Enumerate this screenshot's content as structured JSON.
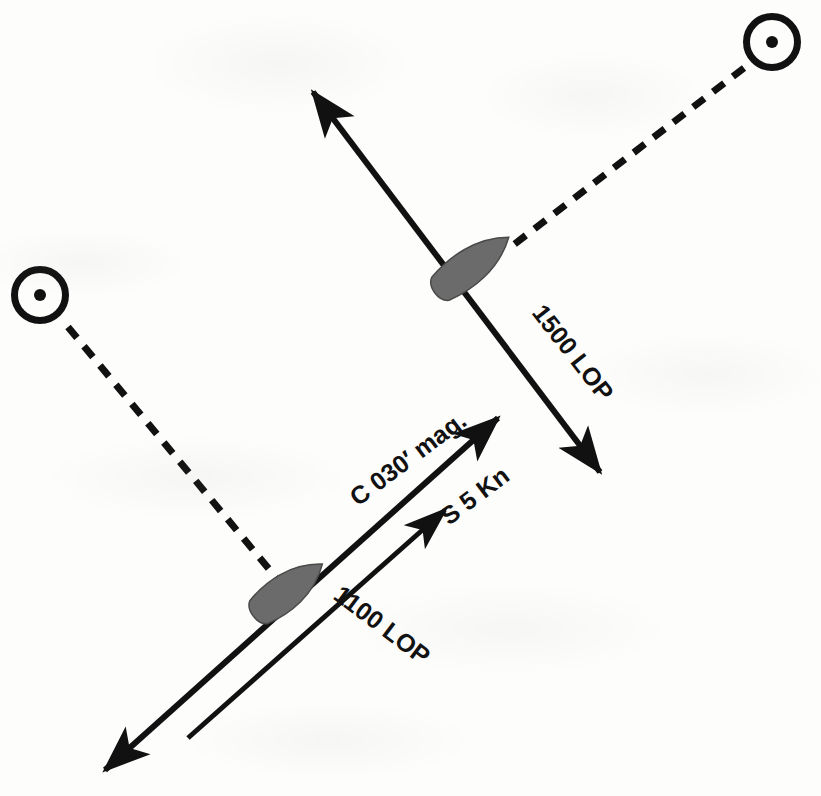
{
  "figure": {
    "kind": "navigation-running-fix-plot",
    "width": 821,
    "height": 796,
    "background_color": "#fdfdfc",
    "ink_color": "#111111",
    "hull_color": "#6b6b6b",
    "hull_outline_color": "#4a4a4a"
  },
  "labels": {
    "lop_1500": "1500 LOP",
    "lop_1100": "1100 LOP",
    "course": "C 030′  mag.",
    "speed": "S 5 Kn"
  },
  "label_geometry": {
    "lop_1500": {
      "x": 531,
      "y": 313,
      "rotation": 52,
      "font_size": 25
    },
    "lop_1100": {
      "x": 332,
      "y": 598,
      "rotation": 37,
      "font_size": 25
    },
    "course": {
      "x": 358,
      "y": 507,
      "rotation": -37,
      "font_size": 25
    },
    "speed": {
      "x": 449,
      "y": 526,
      "rotation": -37,
      "font_size": 25
    }
  },
  "landmarks": [
    {
      "name": "landmark-upper-right",
      "cx": 772,
      "cy": 42,
      "outer_radius": 29,
      "ring_width": 7,
      "dot_radius": 6
    },
    {
      "name": "landmark-left",
      "cx": 40,
      "cy": 295,
      "outer_radius": 29,
      "ring_width": 7,
      "dot_radius": 6
    }
  ],
  "bearing_lines": [
    {
      "name": "bearing-1500",
      "from_x": 744,
      "from_y": 68,
      "to_x": 512,
      "to_y": 246,
      "dash": "14 11",
      "stroke_width": 7
    },
    {
      "name": "bearing-1100",
      "from_x": 68,
      "from_y": 327,
      "to_x": 283,
      "to_y": 586,
      "dash": "14 11",
      "stroke_width": 7
    }
  ],
  "lop_lines": [
    {
      "name": "lop-line-1500",
      "x1": 313,
      "y1": 92,
      "x2": 600,
      "y2": 472,
      "stroke_width": 6,
      "arrow_start": true,
      "arrow_end": true
    },
    {
      "name": "lop-line-1100",
      "x1": 105,
      "y1": 770,
      "x2": 498,
      "y2": 418,
      "stroke_width": 6,
      "arrow_start": true,
      "arrow_end": true
    }
  ],
  "vectors": [
    {
      "name": "speed-vector",
      "x1": 188,
      "y1": 738,
      "x2": 445,
      "y2": 510,
      "stroke_width": 5,
      "arrow_start": false,
      "arrow_end": true
    }
  ],
  "vessels": [
    {
      "name": "vessel-1500-position",
      "cx": 472,
      "cy": 265,
      "length": 92,
      "beam": 40,
      "rotation": -37
    },
    {
      "name": "vessel-1100-position",
      "cx": 288,
      "cy": 590,
      "length": 86,
      "beam": 40,
      "rotation": -37
    }
  ]
}
